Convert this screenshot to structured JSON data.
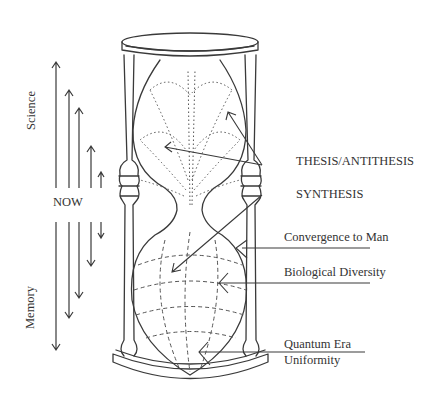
{
  "diagram": {
    "type": "hourglass-concept-sketch",
    "left_axis": {
      "upper_label": "Science",
      "center_label": "NOW",
      "lower_label": "Memory"
    },
    "labels": {
      "thesis": "THESIS/ANTITHESIS",
      "synthesis": "SYNTHESIS",
      "convergence": "Convergence to Man",
      "diversity": "Biological Diversity",
      "quantum_line1": "Quantum Era",
      "quantum_line2": "Uniformity"
    },
    "colors": {
      "ink": "#3a3a3a",
      "background": "#ffffff"
    }
  }
}
